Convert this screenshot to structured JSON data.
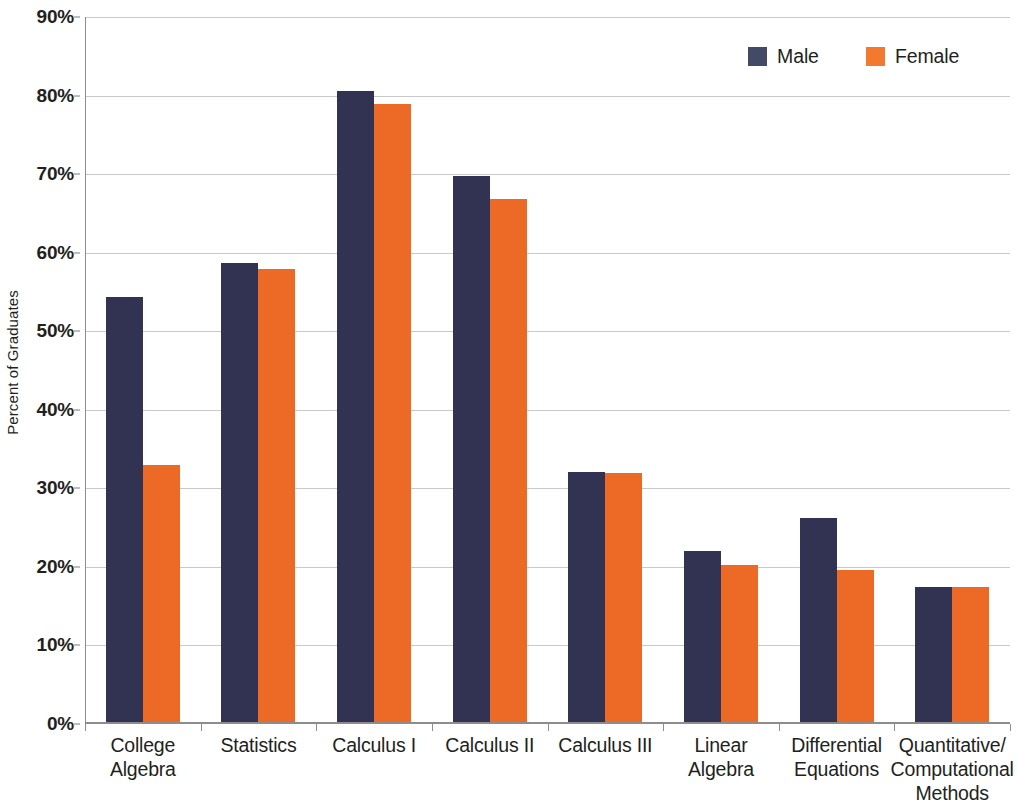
{
  "chart_data": {
    "type": "bar",
    "title": "",
    "subtitle": "",
    "xlabel": "",
    "ylabel": "Percent of Graduates",
    "ylim": [
      0,
      90
    ],
    "ytick_labels": [
      "0%",
      "10%",
      "20%",
      "30%",
      "40%",
      "50%",
      "60%",
      "70%",
      "80%",
      "90%"
    ],
    "ytick_values": [
      0,
      10,
      20,
      30,
      40,
      50,
      60,
      70,
      80,
      90
    ],
    "grid": true,
    "legend_position": "top-right",
    "categories": [
      "College Algebra",
      "Statistics",
      "Calculus I",
      "Calculus II",
      "Calculus III",
      "Linear Algebra",
      "Differential Equations",
      "Quantitative/Computational Methods"
    ],
    "category_label_lines": [
      [
        "College",
        "Algebra"
      ],
      [
        "Statistics"
      ],
      [
        "Calculus I"
      ],
      [
        "Calculus II"
      ],
      [
        "Calculus III"
      ],
      [
        "Linear",
        "Algebra"
      ],
      [
        "Differential",
        "Equations"
      ],
      [
        "Quantitative/",
        "Computational",
        "Methods"
      ]
    ],
    "series": [
      {
        "name": "Male",
        "color": "#323252",
        "values": [
          54.4,
          58.7,
          80.6,
          69.8,
          32.1,
          22.0,
          26.2,
          17.5
        ]
      },
      {
        "name": "Female",
        "color": "#ec6a26",
        "values": [
          33.0,
          57.9,
          78.9,
          66.8,
          32.0,
          20.3,
          19.6,
          17.4
        ]
      }
    ]
  },
  "legend": {
    "items": [
      {
        "label": "Male",
        "color": "#434a66"
      },
      {
        "label": "Female",
        "color": "#f3792f"
      }
    ]
  }
}
